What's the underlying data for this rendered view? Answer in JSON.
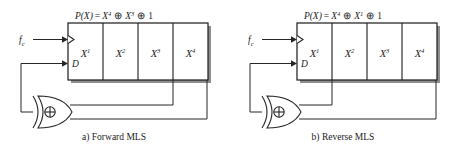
{
  "figure": {
    "background_color": "#ffffff",
    "line_color": "#262626",
    "shadow_color": "#8e8e8e"
  },
  "diagrams": [
    {
      "id": "forward",
      "caption": "a) Forward MLS",
      "polynomial": {
        "lhs": "P(X)",
        "equals": "=",
        "term1_base": "X",
        "term1_exp": "4",
        "xor1": "⊕",
        "term2_base": "X",
        "term2_exp": "3",
        "xor2": "⊕",
        "term3": "1",
        "full_text": "P(X) = X4 ⊕ X3 ⊕ 1"
      },
      "clock_label": "f",
      "clock_subscript": "c",
      "data_label": "D",
      "gate_symbol": "⊕",
      "gate_type": "xor-gate",
      "cells": [
        {
          "base": "X",
          "exp": "1"
        },
        {
          "base": "X",
          "exp": "2"
        },
        {
          "base": "X",
          "exp": "3"
        },
        {
          "base": "X",
          "exp": "4"
        }
      ],
      "taps": [
        "X3",
        "X4"
      ]
    },
    {
      "id": "reverse",
      "caption": "b) Reverse MLS",
      "polynomial": {
        "lhs": "P(X)",
        "equals": "=",
        "term1_base": "X",
        "term1_exp": "4",
        "xor1": "⊕",
        "term2_base": "X",
        "term2_exp": "1",
        "xor2": "⊕",
        "term3": "1",
        "full_text": "P(X) = X4 ⊕ X1 ⊕ 1"
      },
      "clock_label": "f",
      "clock_subscript": "c",
      "data_label": "D",
      "gate_symbol": "⊕",
      "gate_type": "xor-gate",
      "cells": [
        {
          "base": "X",
          "exp": "1"
        },
        {
          "base": "X",
          "exp": "2"
        },
        {
          "base": "X",
          "exp": "3"
        },
        {
          "base": "X",
          "exp": "4"
        }
      ],
      "taps": [
        "X1",
        "X4"
      ]
    }
  ]
}
